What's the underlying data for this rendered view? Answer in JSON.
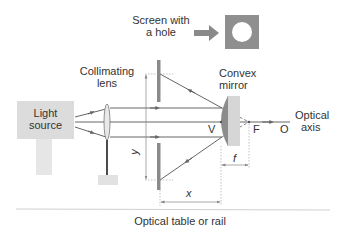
{
  "diagram": {
    "labels": {
      "screen_with_hole": [
        "Screen with",
        "a hole"
      ],
      "collimating_lens": [
        "Collimating",
        "lens"
      ],
      "convex_mirror": [
        "Convex",
        "mirror"
      ],
      "light_source": [
        "Light",
        "source"
      ],
      "optical_axis": [
        "Optical",
        "axis"
      ],
      "vertex": "V",
      "focus": "F",
      "center": "O",
      "y_dim": "y",
      "x_dim": "x",
      "f_dim": "f",
      "table": "Optical table or rail"
    },
    "colors": {
      "ray": "#555555",
      "screen": "#8a8a8a",
      "mirror_face": "#8c8c8c",
      "mirror_back": "#d6d6d6",
      "light_source": "#dcdcdc",
      "hole_icon": "#8f8f8f",
      "rail": "#d0d0d0"
    }
  }
}
